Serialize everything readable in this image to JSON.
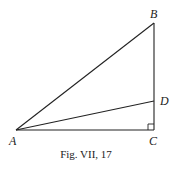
{
  "figure": {
    "caption": "Fig. VII, 17",
    "points": {
      "A": {
        "label": "A",
        "x": 16,
        "y": 130
      },
      "B": {
        "label": "B",
        "x": 154,
        "y": 23
      },
      "C": {
        "label": "C",
        "x": 154,
        "y": 130
      },
      "D": {
        "label": "D",
        "x": 154,
        "y": 101
      }
    },
    "segments": [
      "AB",
      "AC",
      "BC",
      "AD"
    ],
    "right_angle_at": "C",
    "stroke_color": "#222222"
  }
}
